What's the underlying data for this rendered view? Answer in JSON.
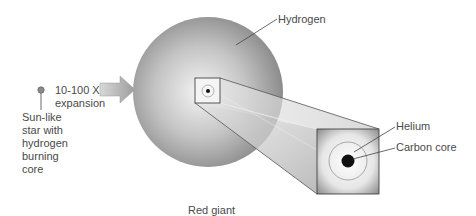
{
  "diagram": {
    "type": "astronomy-illustration",
    "colors": {
      "giant_center": "#f2f2f2",
      "giant_edge": "#8f8f8f",
      "core_dot": "#111111",
      "outline": "#555555",
      "leader_line": "#444444",
      "arrow_fill": "#b0b0b0"
    }
  },
  "labels": {
    "expansion": "10-100 X expansion",
    "expansion_line1": "10-100 X",
    "expansion_line2": "expansion",
    "sun_like_star": "Sun-like star with hydrogen burning core",
    "sun_like_line1": "Sun-like",
    "sun_like_line2": "star with",
    "sun_like_line3": "hydrogen",
    "sun_like_line4": "burning",
    "sun_like_line5": "core",
    "hydrogen": "Hydrogen",
    "helium": "Helium",
    "carbon_core": "Carbon core",
    "red_giant": "Red giant"
  }
}
